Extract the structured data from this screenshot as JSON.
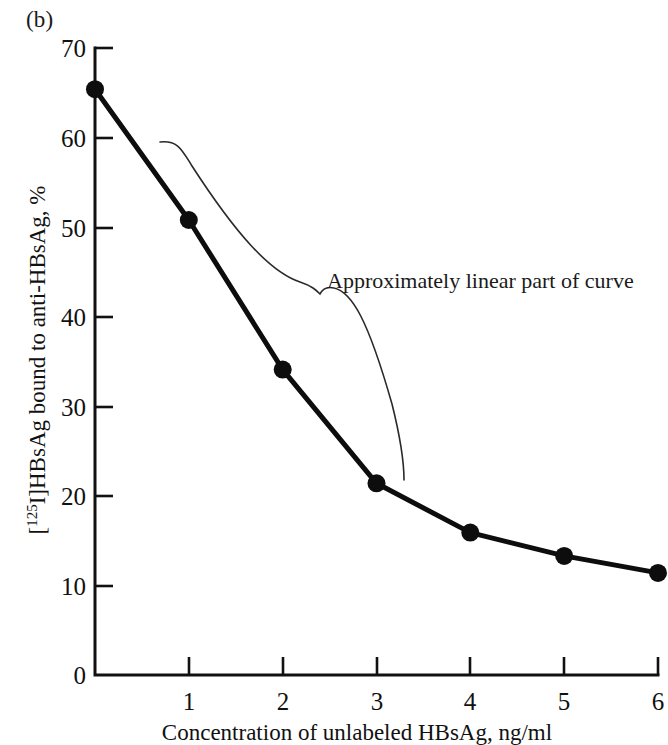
{
  "figure": {
    "panel_label": "(b)"
  },
  "chart_data": {
    "type": "line",
    "title": "",
    "subtitle": "",
    "xlabel": "Concentration of unlabeled HBsAg, ng/ml",
    "ylabel": "[125I]HBsAg bound to anti-HBsAg, %",
    "ylabel_parts": {
      "bracket_open": "[",
      "superscript": "125",
      "isotope": "I]HBsAg bound to anti-HBsAg, %"
    },
    "xlim": [
      0,
      6
    ],
    "ylim": [
      0,
      70
    ],
    "xticks": [
      0,
      1,
      2,
      3,
      4,
      5,
      6
    ],
    "xtick_labels": [
      "0",
      "1",
      "2",
      "3",
      "4",
      "5",
      "6"
    ],
    "yticks": [
      0,
      10,
      20,
      30,
      40,
      50,
      60,
      70
    ],
    "ytick_labels": [
      "0",
      "10",
      "20",
      "30",
      "40",
      "50",
      "60",
      "70"
    ],
    "grid": false,
    "legend": false,
    "marker": "filled-circle",
    "line_color": "#0d0d0d",
    "x": [
      0,
      1,
      2,
      3,
      4,
      5,
      6
    ],
    "values": [
      65.4,
      50.8,
      34.1,
      21.4,
      15.9,
      13.3,
      11.4
    ],
    "series": [
      {
        "name": "[125I]HBsAg bound to anti-HBsAg",
        "values": [
          65.4,
          50.8,
          34.1,
          21.4,
          15.9,
          13.3,
          11.4
        ]
      }
    ],
    "annotations": [
      {
        "text": "Approximately linear part of curve",
        "type": "brace-callout",
        "spans_x": [
          0,
          3
        ],
        "spans_y": [
          65.4,
          21.4
        ]
      }
    ]
  }
}
